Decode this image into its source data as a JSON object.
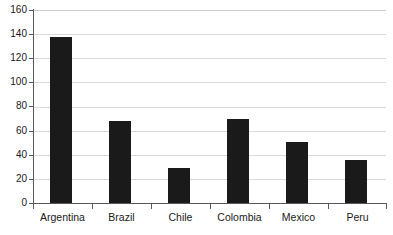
{
  "chart_data": {
    "type": "bar",
    "title": "",
    "subtitle": "",
    "xlabel": "",
    "ylabel": "",
    "categories": [
      "Argentina",
      "Brazil",
      "Chile",
      "Colombia",
      "Mexico",
      "Peru"
    ],
    "values": [
      138,
      68,
      29,
      70,
      51,
      36
    ],
    "series": [
      {
        "name": "",
        "values": [
          138,
          68,
          29,
          70,
          51,
          36
        ]
      }
    ],
    "ylim": [
      0,
      160
    ],
    "ytick_labels": [
      "0",
      "20",
      "40",
      "60",
      "80",
      "100",
      "120",
      "140",
      "160"
    ],
    "ytick_values": [
      0,
      20,
      40,
      60,
      80,
      100,
      120,
      140,
      160
    ],
    "grid": true,
    "grid_axis": "y",
    "legend": false,
    "legend_position": "none",
    "annotations": [],
    "colors": {
      "bar": "#1a1a1a",
      "gridline": "#d9d9d9",
      "axis": "#595959",
      "text": "#1a1a1a",
      "background": "#ffffff"
    }
  }
}
